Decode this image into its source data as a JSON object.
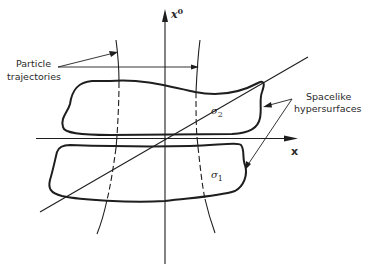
{
  "diagram": {
    "axes": {
      "vertical_label": "x",
      "vertical_superscript": "0",
      "horizontal_label": "x"
    },
    "labels": {
      "particle_line1": "Particle",
      "particle_line2": "trajectories",
      "spacelike_line1": "Spacelike",
      "spacelike_line2": "hypersurfaces"
    },
    "surfaces": {
      "upper": {
        "symbol": "σ",
        "subscript": "2"
      },
      "lower": {
        "symbol": "σ",
        "subscript": "1"
      }
    }
  }
}
